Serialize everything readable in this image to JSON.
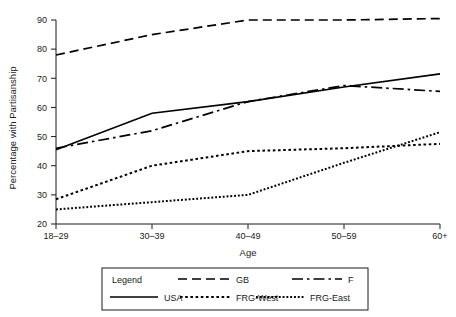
{
  "chart_data": {
    "type": "line",
    "title": "",
    "xlabel": "Age",
    "ylabel": "Percentage with Partisanship",
    "categories": [
      "18–29",
      "30–39",
      "40–49",
      "50–59",
      "60+"
    ],
    "ylim": [
      20,
      90
    ],
    "yticks": [
      20,
      30,
      40,
      50,
      60,
      70,
      80,
      90
    ],
    "ytick_labels": [
      "20",
      "30",
      "40",
      "50",
      "60",
      "70",
      "80",
      "90"
    ],
    "grid": false,
    "legend_position": "below-plot",
    "legend_title": "Legend",
    "series": [
      {
        "name": "GB",
        "style": "dashed",
        "color": "#000000",
        "values": [
          78,
          85,
          90,
          90,
          90.5
        ]
      },
      {
        "name": "F",
        "style": "dash-dot",
        "color": "#000000",
        "values": [
          46,
          52,
          62,
          67.5,
          65.5
        ]
      },
      {
        "name": "USA",
        "style": "solid",
        "color": "#000000",
        "values": [
          45.5,
          58,
          62,
          67,
          71.5
        ]
      },
      {
        "name": "FRG-West",
        "style": "dotted",
        "color": "#000000",
        "values": [
          28.5,
          40,
          45,
          46,
          47.5
        ]
      },
      {
        "name": "FRG-East",
        "style": "fine-dotted",
        "color": "#000000",
        "values": [
          25,
          27.5,
          30,
          41,
          51.5
        ]
      }
    ]
  },
  "legend": {
    "title": "Legend",
    "entries": [
      {
        "label": "GB",
        "style": "dashed"
      },
      {
        "label": "F",
        "style": "dash-dot"
      },
      {
        "label": "USA",
        "style": "solid"
      },
      {
        "label": "FRG-West",
        "style": "dotted"
      },
      {
        "label": "FRG-East",
        "style": "fine-dotted"
      }
    ]
  },
  "axes": {
    "x_title": "Age",
    "y_title": "Percentage with Partisanship",
    "x_tick_labels": [
      "18–29",
      "30–39",
      "40–49",
      "50–59",
      "60+"
    ],
    "y_tick_labels": [
      "20",
      "30",
      "40",
      "50",
      "60",
      "70",
      "80",
      "90"
    ]
  }
}
